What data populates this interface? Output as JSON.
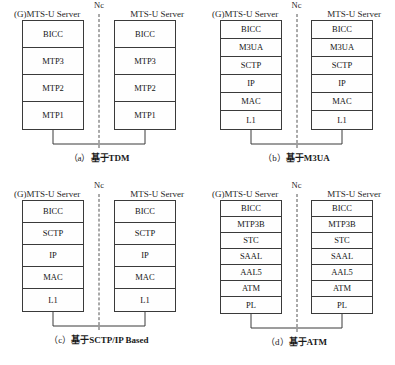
{
  "figure": {
    "panels": [
      {
        "id": "panel-a",
        "left_endpoint": "(G)MTS-U Server",
        "right_endpoint": "MTS-U Server",
        "interface_label": "Nc",
        "caption_index": "（a）",
        "caption_text": "基于TDM",
        "layer_height": 27,
        "layers": [
          "BICC",
          "MTP3",
          "MTP2",
          "MTP1"
        ]
      },
      {
        "id": "panel-b",
        "left_endpoint": "(G)MTS-U Server",
        "right_endpoint": "MTS-U Server",
        "interface_label": "Nc",
        "caption_index": "（b）",
        "caption_text": "基于M3UA",
        "layer_height": 18,
        "layers": [
          "BICC",
          "M3UA",
          "SCTP",
          "IP",
          "MAC",
          "L1"
        ]
      },
      {
        "id": "panel-c",
        "left_endpoint": "(G)MTS-U Server",
        "right_endpoint": "MTS-U Server",
        "interface_label": "Nc",
        "caption_index": "（c）",
        "caption_text": "基于SCTP/IP Based",
        "layer_height": 22,
        "layers": [
          "BICC",
          "SCTP",
          "IP",
          "MAC",
          "L1"
        ]
      },
      {
        "id": "panel-d",
        "left_endpoint": "(G)MTS-U Server",
        "right_endpoint": "MTS-U Server",
        "interface_label": "Nc",
        "caption_index": "（d）",
        "caption_text": "基于ATM",
        "layer_height": 16,
        "layers": [
          "BICC",
          "MTP3B",
          "STC",
          "SAAL",
          "AAL5",
          "ATM",
          "PL"
        ]
      }
    ],
    "colors": {
      "border": "#3a3a3a",
      "divider": "#555555",
      "text": "#1a1a1a",
      "background": "#ffffff"
    }
  }
}
